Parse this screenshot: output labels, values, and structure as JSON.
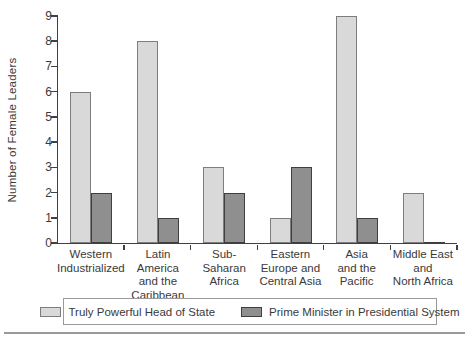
{
  "chart_data": {
    "type": "bar",
    "title": "",
    "xlabel": "",
    "ylabel": "Number of Female Leaders",
    "ylim": [
      0,
      9
    ],
    "yticks": [
      0,
      1,
      2,
      3,
      4,
      5,
      6,
      7,
      8,
      9
    ],
    "grid": false,
    "legend_position": "bottom",
    "categories": [
      "Western\nIndustrialized",
      "Latin America\nand the\nCaribbean",
      "Sub-\nSaharan\nAfrica",
      "Eastern\nEurope and\nCentral Asia",
      "Asia\nand the\nPacific",
      "Middle East\nand\nNorth Africa"
    ],
    "series": [
      {
        "name": "Truly Powerful Head of State",
        "color": "#d9d9d9",
        "border_color": "#7d7d7d",
        "values": [
          6,
          8,
          3,
          1,
          9,
          2
        ]
      },
      {
        "name": "Prime Minister in Presidential System",
        "color": "#8f8f8f",
        "border_color": "#3f3f3f",
        "values": [
          2,
          1,
          2,
          3,
          1,
          0
        ]
      }
    ]
  },
  "colors": {
    "axis": "#404040",
    "text": "#3a3a3a",
    "legend_border": "#9a9a9a",
    "bottom_rule": "#999999",
    "background": "#ffffff"
  }
}
